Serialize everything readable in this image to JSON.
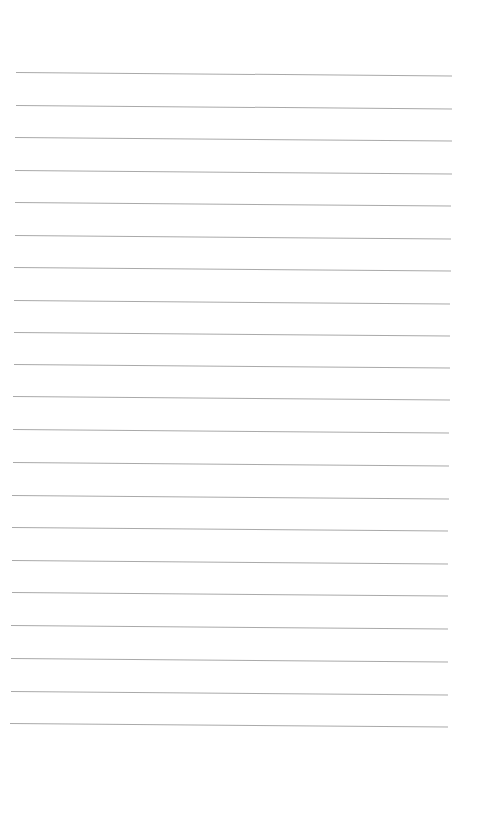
{
  "document": {
    "type": "lined-paper",
    "background_color": "#ffffff",
    "rule_color": "#a9a9a9",
    "rule_count": 21,
    "rules": [
      {
        "y": 72,
        "x1": 16,
        "x2": 452
      },
      {
        "y": 105,
        "x1": 16,
        "x2": 452
      },
      {
        "y": 137,
        "x1": 15,
        "x2": 452
      },
      {
        "y": 170,
        "x1": 15,
        "x2": 452
      },
      {
        "y": 202,
        "x1": 15,
        "x2": 451
      },
      {
        "y": 235,
        "x1": 15,
        "x2": 451
      },
      {
        "y": 267,
        "x1": 14,
        "x2": 451
      },
      {
        "y": 300,
        "x1": 14,
        "x2": 450
      },
      {
        "y": 332,
        "x1": 14,
        "x2": 450
      },
      {
        "y": 364,
        "x1": 14,
        "x2": 450
      },
      {
        "y": 396,
        "x1": 13,
        "x2": 450
      },
      {
        "y": 429,
        "x1": 13,
        "x2": 449
      },
      {
        "y": 462,
        "x1": 13,
        "x2": 449
      },
      {
        "y": 495,
        "x1": 12,
        "x2": 449
      },
      {
        "y": 527,
        "x1": 12,
        "x2": 448
      },
      {
        "y": 560,
        "x1": 12,
        "x2": 448
      },
      {
        "y": 592,
        "x1": 12,
        "x2": 448
      },
      {
        "y": 625,
        "x1": 11,
        "x2": 448
      },
      {
        "y": 658,
        "x1": 11,
        "x2": 448
      },
      {
        "y": 691,
        "x1": 11,
        "x2": 448
      },
      {
        "y": 723,
        "x1": 10,
        "x2": 448
      }
    ]
  }
}
